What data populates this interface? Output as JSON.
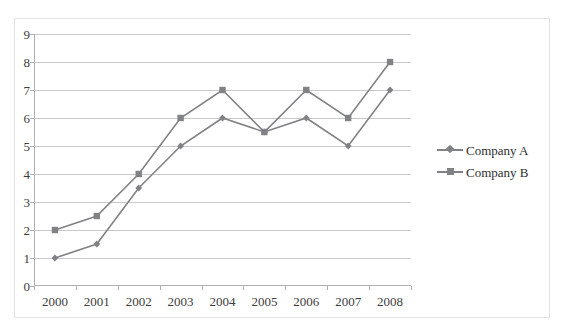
{
  "clipped_top_text": "",
  "chart_data": {
    "type": "line",
    "title": "",
    "subtitle": "",
    "xlabel": "",
    "ylabel": "",
    "categories": [
      "2000",
      "2001",
      "2002",
      "2003",
      "2004",
      "2005",
      "2006",
      "2007",
      "2008"
    ],
    "series": [
      {
        "name": "Company A",
        "marker": "diamond",
        "color": "#808285",
        "values": [
          1,
          1.5,
          3.5,
          5,
          6,
          5.5,
          6,
          5,
          7
        ]
      },
      {
        "name": "Company B",
        "marker": "square",
        "color": "#808285",
        "values": [
          2,
          2.5,
          4,
          6,
          7,
          5.5,
          7,
          6,
          8
        ]
      }
    ],
    "ylim": [
      0,
      9
    ],
    "y_ticks": [
      0,
      1,
      2,
      3,
      4,
      5,
      6,
      7,
      8,
      9
    ],
    "y_tick_labels": [
      "0",
      "1",
      "2",
      "3",
      "4",
      "5",
      "6",
      "7",
      "8",
      "9"
    ],
    "grid": "horizontal",
    "grid_color": "#c9c9c9",
    "legend_position": "right",
    "legend_border": true,
    "plot_background": "#ffffff",
    "axis_color": "#b0b0b0",
    "tick_label_color": "#3d3d3d"
  }
}
